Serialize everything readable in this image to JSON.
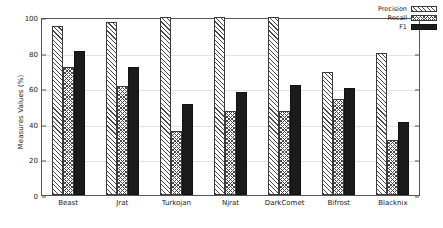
{
  "chart_data": {
    "type": "bar",
    "title": "",
    "xlabel": "",
    "ylabel": "Measures Values (%)",
    "ylim": [
      0,
      100
    ],
    "yticks": [
      0,
      20,
      40,
      60,
      80,
      100
    ],
    "grid": true,
    "legend_position": "top-right",
    "categories": [
      "Beast",
      "Jrat",
      "Turkojan",
      "Njrat",
      "DarkComet",
      "Bifrost",
      "Blacknix"
    ],
    "series": [
      {
        "name": "Precision",
        "pattern": "diagonal-hatch",
        "values": [
          95,
          97,
          100,
          100,
          100,
          69,
          80
        ]
      },
      {
        "name": "Recall",
        "pattern": "cross-hatch",
        "values": [
          72,
          61,
          36,
          47,
          47,
          54,
          31
        ]
      },
      {
        "name": "F1",
        "pattern": "solid-black",
        "values": [
          81,
          72,
          51,
          58,
          62,
          60,
          41
        ]
      }
    ]
  },
  "colors": {
    "bar_outline": "#3a3a3a",
    "f1_fill": "#1b1b1b",
    "hatch": "#4a4a4a",
    "grid": "#e2e2e2",
    "axis": "#555555",
    "background": "#ffffff"
  }
}
